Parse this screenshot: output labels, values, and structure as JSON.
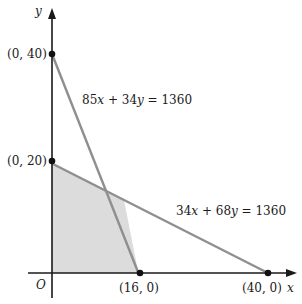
{
  "chart_data": {
    "type": "line",
    "title": "",
    "xlabel": "x",
    "ylabel": "y",
    "origin_label": "O",
    "xlim": [
      0,
      42
    ],
    "ylim": [
      0,
      49
    ],
    "grid": false,
    "series": [
      {
        "name": "85x + 34y = 1360",
        "label": "85x + 34y = 1360",
        "points": [
          [
            0,
            40
          ],
          [
            16,
            0
          ]
        ]
      },
      {
        "name": "34x + 68y = 1360",
        "label": "34x + 68y = 1360",
        "points": [
          [
            0,
            20
          ],
          [
            40,
            0
          ]
        ]
      }
    ],
    "feasible_region": {
      "vertices": [
        [
          0,
          0
        ],
        [
          0,
          20
        ],
        [
          13.33,
          13.33
        ],
        [
          16,
          0
        ]
      ],
      "fill": "#dcdcdc"
    },
    "marked_points": [
      {
        "x": 0,
        "y": 40,
        "label": "(0, 40)"
      },
      {
        "x": 0,
        "y": 20,
        "label": "(0, 20)"
      },
      {
        "x": 16,
        "y": 0,
        "label": "(16, 0)"
      },
      {
        "x": 40,
        "y": 0,
        "label": "(40, 0)"
      }
    ],
    "colors": {
      "axis": "#1a1a1a",
      "constraint_line": "#8f8f8f",
      "region": "#dcdcdc",
      "point": "#111111"
    }
  }
}
